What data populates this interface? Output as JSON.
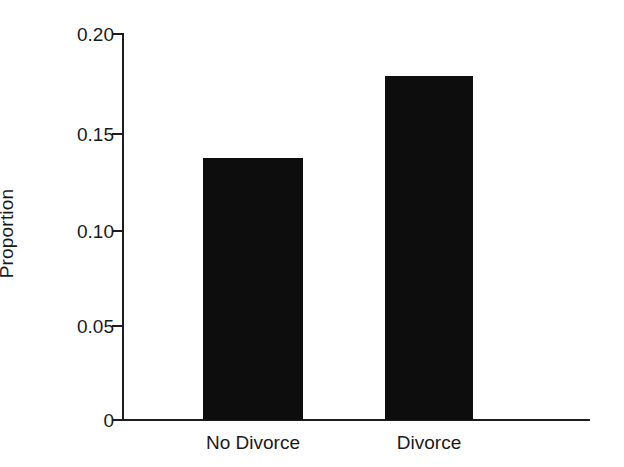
{
  "chart_data": {
    "type": "bar",
    "title": "",
    "xlabel": "",
    "ylabel": "Proportion",
    "categories": [
      "No Divorce",
      "Divorce"
    ],
    "values": [
      0.136,
      0.178
    ],
    "ylim": [
      0,
      0.205
    ],
    "yticks": [
      0,
      0.05,
      0.1,
      0.15,
      0.2
    ],
    "ytick_labels": [
      "0",
      "0.05",
      "0.10",
      "0.15",
      "0.20"
    ],
    "grid": false,
    "legend": null,
    "bar_color": "#0d0d0d",
    "axis_color": "#1d1d1d",
    "background_color": "#ffffff"
  }
}
